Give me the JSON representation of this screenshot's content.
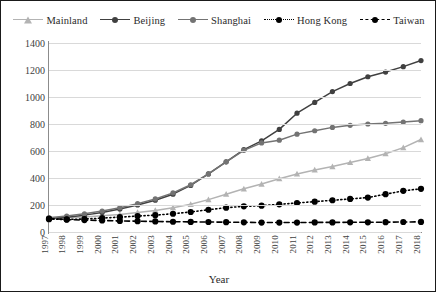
{
  "figure": {
    "background": "#ffffff",
    "border_color": "#1a1a1a"
  },
  "legend": {
    "position": "top-center",
    "items": [
      {
        "label": "Mainland",
        "color": "#b3b3b3",
        "marker": "triangle",
        "dash": "solid"
      },
      {
        "label": "Beijing",
        "color": "#404040",
        "marker": "circle",
        "dash": "solid"
      },
      {
        "label": "Shanghai",
        "color": "#737373",
        "marker": "circle",
        "dash": "solid"
      },
      {
        "label": "Hong Kong",
        "color": "#000000",
        "marker": "circle",
        "dash": "dotted"
      },
      {
        "label": "Taiwan",
        "color": "#000000",
        "marker": "circle",
        "dash": "dashed"
      }
    ]
  },
  "axes": {
    "y_ticks": [
      "0",
      "200",
      "400",
      "600",
      "800",
      "1000",
      "1200",
      "1400"
    ],
    "x_title": "Year"
  },
  "chart_data": {
    "type": "line",
    "title": "",
    "xlabel": "Year",
    "ylabel": "",
    "xlim": [
      1997,
      2018
    ],
    "ylim": [
      0,
      1400
    ],
    "ytick_step": 200,
    "grid": true,
    "legend_position": "top-center",
    "categories": [
      "1997",
      "1998",
      "1999",
      "2000",
      "2001",
      "2002",
      "2003",
      "2004",
      "2005",
      "2006",
      "2007",
      "2008",
      "2009",
      "2010",
      "2011",
      "2012",
      "2013",
      "2014",
      "2015",
      "2016",
      "2017",
      "2018"
    ],
    "series": [
      {
        "name": "Mainland",
        "color": "#b3b3b3",
        "marker": "triangle",
        "dash": "solid",
        "values": [
          100,
          105,
          112,
          120,
          130,
          145,
          160,
          180,
          205,
          240,
          280,
          320,
          355,
          395,
          430,
          460,
          485,
          515,
          545,
          580,
          625,
          685
        ]
      },
      {
        "name": "Beijing",
        "color": "#404040",
        "marker": "circle",
        "dash": "solid",
        "values": [
          100,
          110,
          125,
          145,
          170,
          200,
          235,
          280,
          345,
          430,
          520,
          610,
          675,
          760,
          880,
          960,
          1040,
          1100,
          1150,
          1185,
          1225,
          1270
        ]
      },
      {
        "name": "Shanghai",
        "color": "#737373",
        "marker": "circle",
        "dash": "solid",
        "values": [
          105,
          118,
          135,
          155,
          180,
          210,
          245,
          290,
          350,
          430,
          520,
          605,
          660,
          680,
          725,
          750,
          775,
          790,
          800,
          805,
          815,
          825
        ]
      },
      {
        "name": "Hong Kong",
        "color": "#000000",
        "marker": "circle",
        "dash": "dotted",
        "values": [
          95,
          93,
          96,
          103,
          110,
          118,
          125,
          135,
          148,
          165,
          180,
          190,
          195,
          205,
          215,
          225,
          235,
          245,
          255,
          280,
          305,
          320
        ]
      },
      {
        "name": "Taiwan",
        "color": "#000000",
        "marker": "circle",
        "dash": "dashed",
        "values": [
          100,
          92,
          88,
          85,
          82,
          80,
          78,
          76,
          75,
          74,
          73,
          72,
          70,
          70,
          70,
          71,
          71,
          72,
          72,
          73,
          74,
          75
        ]
      }
    ]
  }
}
